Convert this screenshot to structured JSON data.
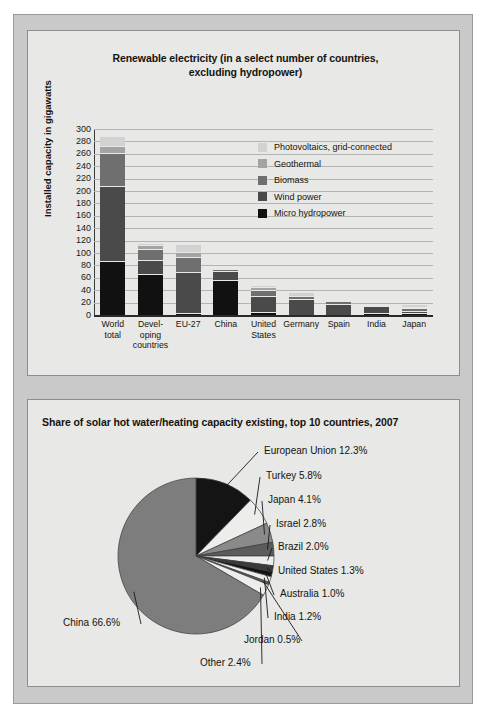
{
  "document": {
    "background_color": "#c9c9c9",
    "panel_color": "#e8e8e6"
  },
  "bar_panel": {
    "title": "Renewable electricity (in a select number of countries, excluding hydropower)",
    "title_line1": "Renewable electricity (in a select number of countries,",
    "title_line2": "excluding hydropower)",
    "y_axis_label": "Installed capacity in gigawatts",
    "legend": [
      {
        "label": "Photovoltaics, grid-connected",
        "color": "#d2d2d2"
      },
      {
        "label": "Geothermal",
        "color": "#a3a3a3"
      },
      {
        "label": "Biomass",
        "color": "#6f6f6f"
      },
      {
        "label": "Wind power",
        "color": "#4a4a4a"
      },
      {
        "label": "Micro hydropower",
        "color": "#111111"
      }
    ]
  },
  "chart_data": [
    {
      "type": "bar",
      "title": "Renewable electricity (in a select number of countries, excluding hydropower)",
      "xlabel": "",
      "ylabel": "Installed capacity in gigawatts",
      "ylim": [
        0,
        300
      ],
      "yticks": [
        0,
        20,
        40,
        60,
        80,
        100,
        120,
        140,
        160,
        180,
        200,
        220,
        240,
        260,
        280,
        300
      ],
      "grid": true,
      "stacked": true,
      "legend_position": "inside-right",
      "categories": [
        "World total",
        "Developing countries",
        "EU-27",
        "China",
        "United States",
        "Germany",
        "Spain",
        "India",
        "Japan"
      ],
      "category_lines": [
        [
          "World",
          "total"
        ],
        [
          "Devel-",
          "oping",
          "countries"
        ],
        [
          "EU-27"
        ],
        [
          "China"
        ],
        [
          "United",
          "States"
        ],
        [
          "Germany"
        ],
        [
          "Spain"
        ],
        [
          "India"
        ],
        [
          "Japan"
        ]
      ],
      "series": [
        {
          "name": "Micro hydropower",
          "color": "#111111",
          "values": [
            85,
            65,
            2,
            55,
            3,
            0,
            0,
            2,
            1
          ]
        },
        {
          "name": "Wind power",
          "color": "#4a4a4a",
          "values": [
            120,
            20,
            64,
            12,
            25,
            24,
            16,
            9,
            2
          ]
        },
        {
          "name": "Biomass",
          "color": "#6f6f6f",
          "values": [
            52,
            17,
            22,
            3,
            8,
            4,
            3,
            1,
            3
          ]
        },
        {
          "name": "Geothermal",
          "color": "#a3a3a3",
          "values": [
            10,
            5,
            8,
            0,
            3,
            0,
            0,
            0,
            1
          ]
        },
        {
          "name": "Photovoltaics, grid-connected",
          "color": "#d2d2d2",
          "values": [
            13,
            1,
            11,
            0,
            1,
            5,
            1,
            0,
            2
          ]
        }
      ],
      "totals": [
        280,
        108,
        107,
        70,
        40,
        33,
        20,
        12,
        9
      ]
    },
    {
      "type": "pie",
      "title": "Share of solar hot water/heating capacity existing, top 10 countries, 2007",
      "start_angle_deg": 0,
      "direction": "clockwise",
      "labels": [
        "European Union",
        "Turkey",
        "Japan",
        "Israel",
        "Brazil",
        "United States",
        "Australia",
        "India",
        "Jordan",
        "Other",
        "China"
      ],
      "values": [
        12.3,
        5.8,
        4.1,
        2.8,
        2.0,
        1.3,
        1.0,
        1.2,
        0.5,
        2.4,
        66.6
      ],
      "slices": [
        {
          "label": "European Union",
          "value": 12.3,
          "text": "European Union 12.3%",
          "color": "#141414"
        },
        {
          "label": "Turkey",
          "value": 5.8,
          "text": "Turkey 5.8%",
          "color": "#ededeb"
        },
        {
          "label": "Japan",
          "value": 4.1,
          "text": "Japan 4.1%",
          "color": "#8a8a8a"
        },
        {
          "label": "Israel",
          "value": 2.8,
          "text": "Israel 2.8%",
          "color": "#5c5c5c"
        },
        {
          "label": "Brazil",
          "value": 2.0,
          "text": "Brazil 2.0%",
          "color": "#ededeb"
        },
        {
          "label": "United States",
          "value": 1.3,
          "text": "United States 1.3%",
          "color": "#3a3a3a"
        },
        {
          "label": "Australia",
          "value": 1.0,
          "text": "Australia 1.0%",
          "color": "#141414"
        },
        {
          "label": "India",
          "value": 1.2,
          "text": "India 1.2%",
          "color": "#ededeb"
        },
        {
          "label": "Jordan",
          "value": 0.5,
          "text": "Jordan 0.5%",
          "color": "#5c5c5c"
        },
        {
          "label": "Other",
          "value": 2.4,
          "text": "Other 2.4%",
          "color": "#ededeb"
        },
        {
          "label": "China",
          "value": 66.6,
          "text": "China 66.6%",
          "color": "#7d7d7d"
        }
      ]
    }
  ],
  "pie_panel": {
    "title": "Share of solar hot water/heating capacity existing, top 10 countries, 2007"
  }
}
